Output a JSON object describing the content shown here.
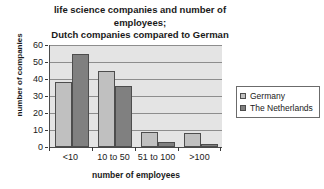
{
  "chart_data": {
    "type": "bar",
    "title": "life science companies and number of employees; Dutch companies compared to German",
    "title_lines": [
      "life science companies and number of",
      "employees;",
      "Dutch companies compared to German"
    ],
    "xlabel": "number of employees",
    "ylabel": "number of companies",
    "categories": [
      "<10",
      "10 to 50",
      "51 to 100",
      ">100"
    ],
    "series": [
      {
        "name": "Germany",
        "values": [
          38,
          45,
          9,
          8
        ],
        "color": "#c0c0c0"
      },
      {
        "name": "The Netherlands",
        "values": [
          55,
          36,
          3,
          2
        ],
        "color": "#808080"
      }
    ],
    "ylim": [
      0,
      60
    ],
    "yticks": [
      60,
      50,
      40,
      30,
      20,
      10,
      0
    ],
    "grid": true,
    "legend_position": "right",
    "plot_background": "#e4e4e4",
    "gridline_color": "#8d8d8d",
    "axis_color": "#4a4a4a"
  }
}
